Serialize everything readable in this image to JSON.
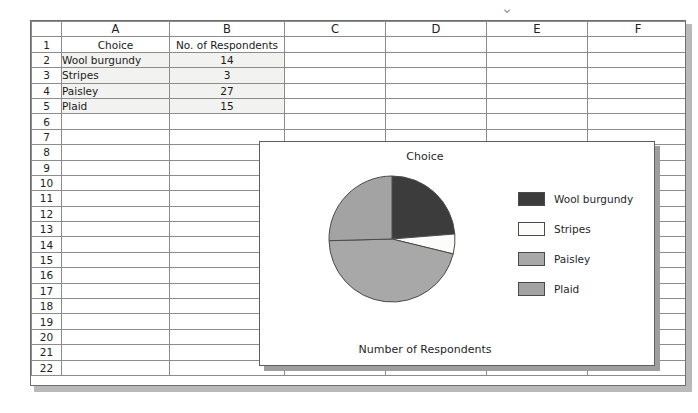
{
  "top_bar": {
    "chevron_icon": "⌄",
    "chevron_name": "chevron-down-icon"
  },
  "spreadsheet": {
    "column_headers": [
      "A",
      "B",
      "C",
      "D",
      "E",
      "F"
    ],
    "row_numbers": [
      "1",
      "2",
      "3",
      "4",
      "5",
      "6",
      "7",
      "8",
      "9",
      "10",
      "11",
      "12",
      "13",
      "14",
      "15",
      "16",
      "17",
      "18",
      "19",
      "20",
      "21",
      "22"
    ],
    "rows": [
      {
        "num": "1",
        "A": "Choice",
        "B": "No. of Respondents",
        "shaded": false,
        "a_center": true
      },
      {
        "num": "2",
        "A": "Wool burgundy",
        "B": "14",
        "shaded": true,
        "a_center": false
      },
      {
        "num": "3",
        "A": "Stripes",
        "B": "3",
        "shaded": true,
        "a_center": false
      },
      {
        "num": "4",
        "A": "Paisley",
        "B": "27",
        "shaded": true,
        "a_center": false
      },
      {
        "num": "5",
        "A": "Plaid",
        "B": "15",
        "shaded": true,
        "a_center": false
      },
      {
        "num": "6",
        "A": "",
        "B": "",
        "shaded": false,
        "a_center": false
      },
      {
        "num": "7",
        "A": "",
        "B": "",
        "shaded": false,
        "a_center": false
      },
      {
        "num": "8",
        "A": "",
        "B": "",
        "shaded": false,
        "a_center": false
      },
      {
        "num": "9",
        "A": "",
        "B": "",
        "shaded": false,
        "a_center": false
      },
      {
        "num": "10",
        "A": "",
        "B": "",
        "shaded": false,
        "a_center": false
      },
      {
        "num": "11",
        "A": "",
        "B": "",
        "shaded": false,
        "a_center": false
      },
      {
        "num": "12",
        "A": "",
        "B": "",
        "shaded": false,
        "a_center": false
      },
      {
        "num": "13",
        "A": "",
        "B": "",
        "shaded": false,
        "a_center": false
      },
      {
        "num": "14",
        "A": "",
        "B": "",
        "shaded": false,
        "a_center": false
      },
      {
        "num": "15",
        "A": "",
        "B": "",
        "shaded": false,
        "a_center": false
      },
      {
        "num": "16",
        "A": "",
        "B": "",
        "shaded": false,
        "a_center": false
      },
      {
        "num": "17",
        "A": "",
        "B": "",
        "shaded": false,
        "a_center": false
      },
      {
        "num": "18",
        "A": "",
        "B": "",
        "shaded": false,
        "a_center": false
      },
      {
        "num": "19",
        "A": "",
        "B": "",
        "shaded": false,
        "a_center": false
      },
      {
        "num": "20",
        "A": "",
        "B": "",
        "shaded": false,
        "a_center": false
      },
      {
        "num": "21",
        "A": "",
        "B": "",
        "shaded": false,
        "a_center": false
      },
      {
        "num": "22",
        "A": "",
        "B": "",
        "shaded": false,
        "a_center": false
      }
    ]
  },
  "chart_data": {
    "type": "pie",
    "title": "Choice",
    "xlabel": "Number of Respondents",
    "ylabel": "",
    "categories": [
      "Wool burgundy",
      "Stripes",
      "Paisley",
      "Plaid"
    ],
    "values": [
      14,
      3,
      27,
      15
    ],
    "total": 59,
    "colors": [
      "#3c3c3c",
      "#fcfcfa",
      "#a8a8a8",
      "#a3a3a3"
    ],
    "slice_border": "#4a4a4a",
    "start_angle_deg": 0,
    "direction": "clockwise",
    "legend_position": "right",
    "grid": false
  }
}
